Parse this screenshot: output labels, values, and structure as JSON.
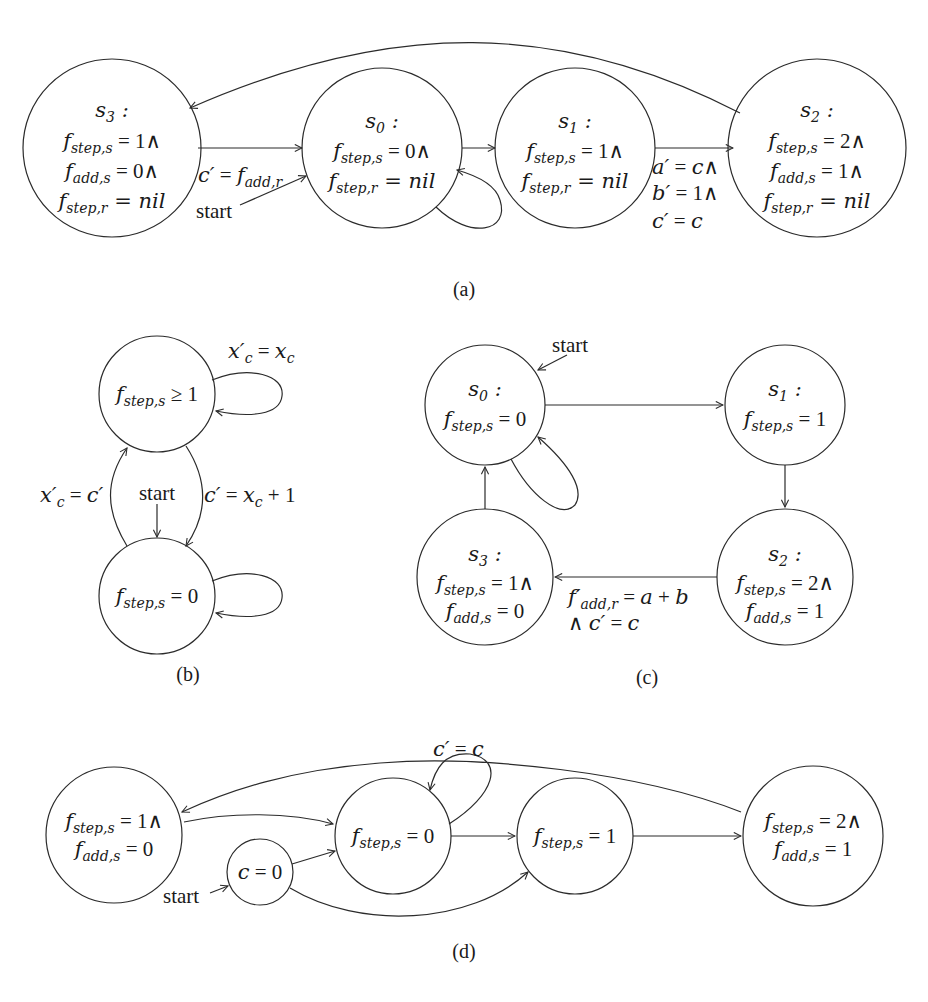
{
  "figure": {
    "a": {
      "caption": "(a)",
      "states": [
        {
          "id": "s3",
          "title": "s3 :",
          "lines": [
            "f_step,s = 1∧",
            "f_add,s = 0∧",
            "f_step,r = nil"
          ]
        },
        {
          "id": "s0",
          "title": "s0 :",
          "lines": [
            "f_step,s = 0∧",
            "f_step,r = nil"
          ]
        },
        {
          "id": "s1",
          "title": "s1 :",
          "lines": [
            "f_step,s = 1∧",
            "f_step,r = nil"
          ]
        },
        {
          "id": "s2",
          "title": "s2 :",
          "lines": [
            "f_step,s = 2∧",
            "f_add,s = 1∧",
            "f_step,r = nil"
          ]
        }
      ],
      "edges": [
        {
          "from": "s3",
          "to": "s0",
          "label": "c′ = f_add,r"
        },
        {
          "from": "s0",
          "to": "s0",
          "label": ""
        },
        {
          "from": "s0",
          "to": "s1",
          "label": ""
        },
        {
          "from": "s1",
          "to": "s2",
          "label": [
            "a′ = c∧",
            "b′ = 1∧",
            "c′ = c"
          ]
        },
        {
          "from": "s2",
          "to": "s3",
          "label": ""
        }
      ],
      "start_label": "start",
      "start_state": "s0"
    },
    "b": {
      "caption": "(b)",
      "states": [
        {
          "id": "top",
          "lines": [
            "f_step,s ≥ 1"
          ]
        },
        {
          "id": "bottom",
          "lines": [
            "f_step,s = 0"
          ]
        }
      ],
      "edges": [
        {
          "from": "top",
          "to": "top",
          "label": "x′_c = x_c"
        },
        {
          "from": "bottom",
          "to": "top",
          "label": "x′_c = c′"
        },
        {
          "from": "top",
          "to": "bottom",
          "label": "c′ = x_c + 1"
        },
        {
          "from": "bottom",
          "to": "bottom",
          "label": ""
        }
      ],
      "start_label": "start",
      "start_state": "bottom"
    },
    "c": {
      "caption": "(c)",
      "states": [
        {
          "id": "s0",
          "title": "s0 :",
          "lines": [
            "f_step,s = 0"
          ]
        },
        {
          "id": "s1",
          "title": "s1 :",
          "lines": [
            "f_step,s = 1"
          ]
        },
        {
          "id": "s2",
          "title": "s2 :",
          "lines": [
            "f_step,s = 2∧",
            "f_add,s = 1"
          ]
        },
        {
          "id": "s3",
          "title": "s3 :",
          "lines": [
            "f_step,s = 1∧",
            "f_add,s = 0"
          ]
        }
      ],
      "edges": [
        {
          "from": "s0",
          "to": "s1",
          "label": ""
        },
        {
          "from": "s1",
          "to": "s2",
          "label": ""
        },
        {
          "from": "s2",
          "to": "s3",
          "label": [
            "f′_add,r = a + b",
            "∧ c′ = c"
          ]
        },
        {
          "from": "s3",
          "to": "s0",
          "label": ""
        },
        {
          "from": "s0",
          "to": "s0",
          "label": ""
        }
      ],
      "start_label": "start",
      "start_state": "s0"
    },
    "d": {
      "caption": "(d)",
      "states": [
        {
          "id": "q3",
          "lines": [
            "f_step,s = 1∧",
            "f_add,s = 0"
          ]
        },
        {
          "id": "init",
          "lines": [
            "c = 0"
          ]
        },
        {
          "id": "q0",
          "lines": [
            "f_step,s = 0"
          ]
        },
        {
          "id": "q1",
          "lines": [
            "f_step,s = 1"
          ]
        },
        {
          "id": "q2",
          "lines": [
            "f_step,s = 2∧",
            "f_add,s = 1"
          ]
        }
      ],
      "edges": [
        {
          "from": "q3",
          "to": "q0",
          "label": ""
        },
        {
          "from": "init",
          "to": "q0",
          "label": ""
        },
        {
          "from": "init",
          "to": "q1",
          "label": ""
        },
        {
          "from": "q0",
          "to": "q0",
          "label": "c′ = c"
        },
        {
          "from": "q0",
          "to": "q1",
          "label": ""
        },
        {
          "from": "q1",
          "to": "q2",
          "label": ""
        },
        {
          "from": "q2",
          "to": "q3",
          "label": ""
        }
      ],
      "start_label": "start",
      "start_state": "init"
    }
  }
}
